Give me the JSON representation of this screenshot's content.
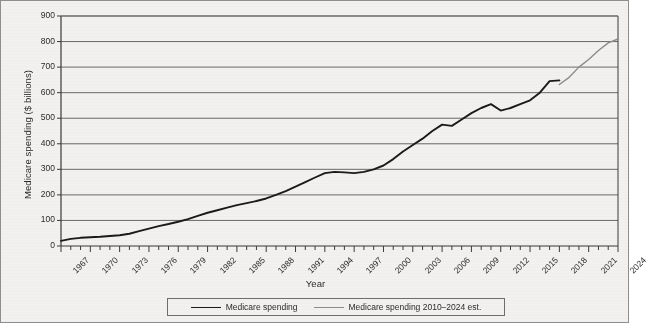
{
  "chart_data": {
    "type": "line",
    "title": "",
    "xlabel": "Year",
    "ylabel": "Medicare spending ($ billions)",
    "xlim": [
      1967,
      2024
    ],
    "ylim": [
      0,
      900
    ],
    "ytick_step": 100,
    "yticks": [
      0,
      100,
      200,
      300,
      400,
      500,
      600,
      700,
      800,
      900
    ],
    "xticks": [
      1967,
      1970,
      1973,
      1976,
      1979,
      1982,
      1985,
      1988,
      1991,
      1994,
      1997,
      2000,
      2003,
      2006,
      2009,
      2012,
      2015,
      2018,
      2021,
      2024
    ],
    "xtick_labels": [
      "1967",
      "1970",
      "1973",
      "1976",
      "1979",
      "1982",
      "1985",
      "1988",
      "1991",
      "1994",
      "1997",
      "2000",
      "2003",
      "2006",
      "2009",
      "2012",
      "2015",
      "2018",
      "2021",
      "2024"
    ],
    "minor_xticks_every": 1,
    "grid": "horizontal",
    "legend_position": "below-axes",
    "colors": {
      "series_actual": "#1a1a1a",
      "series_estimate": "#8c8c8c",
      "grid": "#6a6a6a",
      "axis": "#3a3a3a",
      "background": "#f2f1ef"
    },
    "x": [
      1967,
      1968,
      1969,
      1970,
      1971,
      1972,
      1973,
      1974,
      1975,
      1976,
      1977,
      1978,
      1979,
      1980,
      1981,
      1982,
      1983,
      1984,
      1985,
      1986,
      1987,
      1988,
      1989,
      1990,
      1991,
      1992,
      1993,
      1994,
      1995,
      1996,
      1997,
      1998,
      1999,
      2000,
      2001,
      2002,
      2003,
      2004,
      2005,
      2006,
      2007,
      2008,
      2009,
      2010,
      2011,
      2012,
      2013,
      2014,
      2015,
      2016,
      2017,
      2018,
      2019,
      2020,
      2021,
      2022,
      2023,
      2024
    ],
    "series": [
      {
        "name": "Medicare spending",
        "color": "#1a1a1a",
        "x": [
          1967,
          1968,
          1969,
          1970,
          1971,
          1972,
          1973,
          1974,
          1975,
          1976,
          1977,
          1978,
          1979,
          1980,
          1981,
          1982,
          1983,
          1984,
          1985,
          1986,
          1987,
          1988,
          1989,
          1990,
          1991,
          1992,
          1993,
          1994,
          1995,
          1996,
          1997,
          1998,
          1999,
          2000,
          2001,
          2002,
          2003,
          2004,
          2005,
          2006,
          2007,
          2008,
          2009,
          2010,
          2011,
          2012,
          2013,
          2014,
          2015,
          2016,
          2017,
          2018
        ],
        "values": [
          20,
          28,
          32,
          34,
          36,
          39,
          42,
          48,
          58,
          68,
          78,
          86,
          95,
          105,
          118,
          130,
          140,
          150,
          160,
          168,
          176,
          186,
          200,
          215,
          232,
          250,
          268,
          285,
          290,
          288,
          285,
          290,
          300,
          315,
          340,
          370,
          395,
          420,
          450,
          475,
          470,
          495,
          520,
          540,
          555,
          530,
          540,
          555,
          570,
          600,
          645,
          648
        ],
        "linewidth": 1.9
      },
      {
        "name": "Medicare spending 2010-2024 est.",
        "label": "Medicare spending 2010–2024 est.",
        "color": "#8c8c8c",
        "x": [
          2018,
          2019,
          2020,
          2021,
          2022,
          2023,
          2024
        ],
        "values": [
          632,
          660,
          700,
          730,
          765,
          795,
          810
        ],
        "linewidth": 1.4
      }
    ]
  },
  "legend": {
    "entries": [
      {
        "label": "Medicare spending",
        "swatch": "primary"
      },
      {
        "label": "Medicare spending 2010–2024 est.",
        "swatch": "est"
      }
    ]
  },
  "axes": {
    "x_title": "Year",
    "y_title": "Medicare spending ($ billions)"
  }
}
